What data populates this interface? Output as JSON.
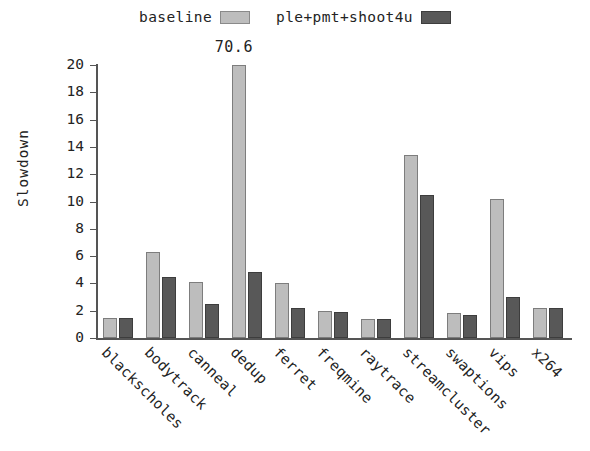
{
  "legend": {
    "entries": [
      {
        "label": "baseline",
        "color": "#bdbdbd",
        "swatch_name": "legend-swatch-baseline"
      },
      {
        "label": "ple+pmt+shoot4u",
        "color": "#585858",
        "swatch_name": "legend-swatch-treated"
      }
    ]
  },
  "annotations": {
    "canneal_clipped_value": "70.6"
  },
  "chart_data": {
    "type": "bar",
    "title": "",
    "xlabel": "",
    "ylabel": "Slowdown",
    "ylim": [
      0,
      20
    ],
    "yticks": [
      0,
      2,
      4,
      6,
      8,
      10,
      12,
      14,
      16,
      18,
      20
    ],
    "ytick_labels": [
      "0",
      "2",
      "4",
      "6",
      "8",
      "10",
      "12",
      "14",
      "16",
      "18",
      "20"
    ],
    "grid": false,
    "legend_position": "top-center",
    "categories": [
      "blackscholes",
      "bodytrack",
      "canneal",
      "dedup",
      "ferret",
      "freqmine",
      "raytrace",
      "streamcluster",
      "swaptions",
      "vips",
      "x264"
    ],
    "series": [
      {
        "name": "baseline",
        "color": "#bdbdbd",
        "values": [
          1.5,
          6.3,
          4.1,
          70.6,
          4.0,
          2.0,
          1.4,
          13.4,
          1.8,
          10.2,
          2.2
        ],
        "clipped": [
          false,
          false,
          false,
          true,
          false,
          false,
          false,
          false,
          false,
          false,
          false
        ]
      },
      {
        "name": "ple+pmt+shoot4u",
        "color": "#585858",
        "values": [
          1.5,
          4.5,
          2.5,
          4.8,
          2.2,
          1.9,
          1.4,
          10.5,
          1.7,
          3.0,
          2.2
        ],
        "clipped": [
          false,
          false,
          false,
          false,
          false,
          false,
          false,
          false,
          false,
          false,
          false
        ]
      }
    ],
    "data_labels": [
      {
        "category": "dedup",
        "series": "baseline",
        "text": "70.6"
      }
    ]
  }
}
